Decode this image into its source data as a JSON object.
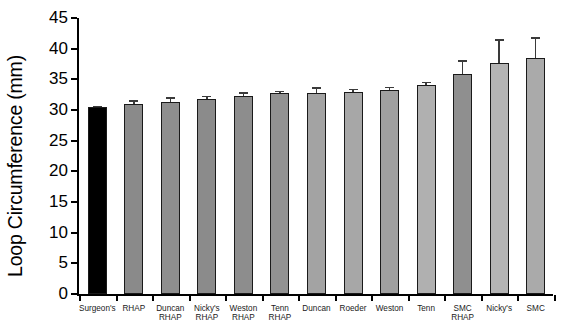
{
  "chart_data": {
    "type": "bar",
    "title": "",
    "xlabel": "",
    "ylabel": "Loop Circumference (mm)",
    "ylim": [
      0,
      45
    ],
    "yticks": [
      0,
      5,
      10,
      15,
      20,
      25,
      30,
      35,
      40,
      45
    ],
    "grid": false,
    "legend": "none",
    "error_bars": "standard error (upper whisker shown)",
    "categories": [
      "Surgeon's",
      "RHAP",
      "Duncan\nRHAP",
      "Nicky's\nRHAP",
      "Weston\nRHAP",
      "Tenn RHAP",
      "Duncan",
      "Roeder",
      "Weston",
      "Tenn",
      "SMC RHAP",
      "Nicky's",
      "SMC"
    ],
    "values": [
      30.5,
      31.0,
      31.3,
      31.8,
      32.3,
      32.7,
      32.8,
      32.9,
      33.3,
      34.1,
      35.8,
      37.6,
      38.4
    ],
    "errors": [
      0.2,
      0.6,
      0.8,
      0.5,
      0.6,
      0.4,
      0.9,
      0.6,
      0.5,
      0.5,
      2.3,
      3.9,
      3.5
    ],
    "bar_colors": [
      "#000000",
      "#8a8a8a",
      "#8e8e8e",
      "#8b8b8b",
      "#8d8d8d",
      "#929292",
      "#a3a3a3",
      "#a7a7a7",
      "#a0a0a0",
      "#b0b0b0",
      "#8f8f8f",
      "#b4b4b4",
      "#aaaaaa"
    ]
  }
}
